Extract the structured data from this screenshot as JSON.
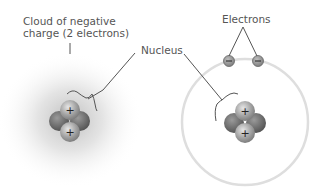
{
  "labels": {
    "cloud_line1": "Cloud of negative",
    "cloud_line2": "charge (2 electrons)",
    "nucleus": "Nucleus",
    "electrons": "Electrons"
  },
  "symbols": {
    "proton": "+",
    "electron": "−"
  },
  "colors": {
    "cloud": "#9a9a9a",
    "orbit": "#dcdcdc",
    "proton": "#a8a8a8",
    "neutron": "#707070",
    "electron": "#8a8a8a",
    "line": "#555555",
    "text": "#555555"
  }
}
